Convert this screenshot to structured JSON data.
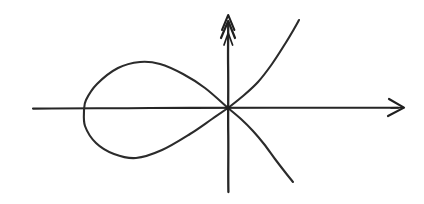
{
  "figure": {
    "background_color": "#ffffff",
    "ink_color": "#262626",
    "width": 424,
    "height": 204
  },
  "chart_data": {
    "type": "line",
    "subtitle": "",
    "xlabel": "",
    "ylabel": "",
    "grid": false,
    "legend": "none",
    "style": "hand-drawn sketch, no tick marks, no axis labels, no numbers",
    "axis_origin_px": [
      228,
      108
    ],
    "xlim_px": [
      33,
      405
    ],
    "ylim_px": [
      192,
      20
    ],
    "annotations": [
      "x-axis drawn as horizontal line with single open arrowhead pointing right",
      "y-axis drawn as vertical line with doubled feathered arrowhead pointing up",
      "curve self-intersects (node) exactly at the origin",
      "large teardrop loop occupies the second and third quadrants to the left of the origin",
      "two open branches extend to the upper right and lower right of the origin"
    ],
    "series": [
      {
        "name": "x-axis",
        "kind": "axis",
        "x": [
          33,
          405
        ],
        "y": [
          108,
          108
        ],
        "arrow_end": "right"
      },
      {
        "name": "y-axis",
        "kind": "axis",
        "x": [
          228,
          228
        ],
        "y": [
          192,
          20
        ],
        "arrow_end": "up"
      },
      {
        "name": "loop-upper",
        "kind": "curve",
        "points": [
          [
            228,
            108
          ],
          [
            205,
            88
          ],
          [
            183,
            74
          ],
          [
            160,
            64
          ],
          [
            140,
            62
          ],
          [
            118,
            68
          ],
          [
            97,
            84
          ],
          [
            86,
            100
          ],
          [
            84,
            110
          ]
        ]
      },
      {
        "name": "loop-lower",
        "kind": "curve",
        "points": [
          [
            84,
            110
          ],
          [
            85,
            126
          ],
          [
            96,
            143
          ],
          [
            114,
            154
          ],
          [
            136,
            158
          ],
          [
            162,
            150
          ],
          [
            190,
            134
          ],
          [
            212,
            119
          ],
          [
            228,
            108
          ]
        ]
      },
      {
        "name": "branch-upper-right",
        "kind": "curve",
        "points": [
          [
            228,
            108
          ],
          [
            243,
            96
          ],
          [
            258,
            82
          ],
          [
            272,
            64
          ],
          [
            285,
            44
          ],
          [
            294,
            29
          ],
          [
            299,
            20
          ]
        ]
      },
      {
        "name": "branch-lower-right",
        "kind": "curve",
        "points": [
          [
            228,
            108
          ],
          [
            241,
            119
          ],
          [
            253,
            131
          ],
          [
            264,
            144
          ],
          [
            275,
            159
          ],
          [
            285,
            172
          ],
          [
            293,
            182
          ]
        ]
      }
    ],
    "key_points": {
      "node_origin": [
        228,
        108
      ],
      "loop_leftmost": [
        84,
        110
      ],
      "loop_top": [
        143,
        62
      ],
      "loop_bottom": [
        136,
        158
      ],
      "upper_branch_end": [
        299,
        20
      ],
      "lower_branch_end": [
        293,
        182
      ],
      "x_axis_arrow_tip": [
        405,
        108
      ],
      "y_axis_arrow_tip": [
        228,
        20
      ]
    }
  }
}
